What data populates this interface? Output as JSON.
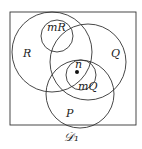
{
  "diagram": {
    "type": "venn",
    "caption": "𝒟₁",
    "sets": [
      {
        "id": "R",
        "label": "R"
      },
      {
        "id": "mR",
        "label": "mR"
      },
      {
        "id": "Q",
        "label": "Q"
      },
      {
        "id": "mQ",
        "label": "mQ"
      },
      {
        "id": "P",
        "label": "P"
      }
    ],
    "point": {
      "label": "n"
    }
  }
}
